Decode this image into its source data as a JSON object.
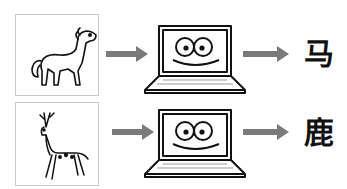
{
  "rows": [
    {
      "animal": "horse",
      "input_label": "horse-drawing",
      "output_char": "马"
    },
    {
      "animal": "deer",
      "input_label": "deer-drawing",
      "output_char": "鹿"
    }
  ],
  "colors": {
    "arrow": "#7a7a7a",
    "frame": "#c8c8c8",
    "ink": "#111111"
  }
}
